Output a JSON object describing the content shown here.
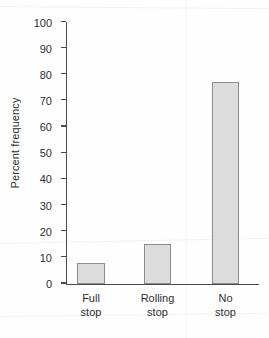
{
  "chart_data": {
    "type": "bar",
    "title": "",
    "xlabel": "",
    "ylabel": "Percent frequency",
    "categories": [
      "Full stop",
      "Rolling stop",
      "No stop"
    ],
    "category_lines": [
      [
        "Full",
        "stop"
      ],
      [
        "Rolling",
        "stop"
      ],
      [
        "No",
        "stop"
      ]
    ],
    "values": [
      8,
      15,
      77
    ],
    "ylim": [
      0,
      100
    ],
    "ytick_step": 10,
    "yticks": [
      0,
      10,
      20,
      30,
      40,
      50,
      60,
      70,
      80,
      90,
      100
    ],
    "ytick_labels": [
      "0",
      "10",
      "20",
      "30",
      "40",
      "50",
      "60",
      "70",
      "80",
      "90",
      "100"
    ],
    "grid": false,
    "legend": null,
    "bar_fill_color": "#dcdcdc",
    "bar_edge_color": "#8c8c8c",
    "axis_color": "#4a4a4a",
    "text_color": "#2e2e2e",
    "background_color": "#fefefe"
  }
}
